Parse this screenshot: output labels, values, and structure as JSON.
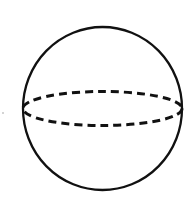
{
  "diagram": {
    "type": "sphere",
    "stroke_color": "#111111",
    "background": "#ffffff",
    "outline": {
      "cx": 102.5,
      "cy": 108.5,
      "rx": 79.5,
      "ry": 81.5
    },
    "equator": {
      "cx": 102.5,
      "cy": 108.5,
      "rx": 79.5,
      "ry": 17,
      "style": "dashed"
    },
    "speck": {
      "x": 3,
      "y": 113
    }
  }
}
